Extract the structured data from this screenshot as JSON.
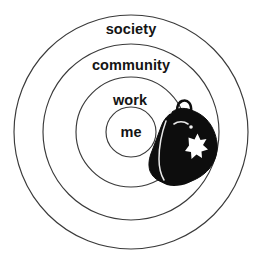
{
  "diagram": {
    "type": "concentric-rings",
    "title_visible": false,
    "background_color": "#ffffff",
    "stroke_color": "#3a3a3a",
    "text_color": "#141414",
    "center": {
      "x": 131,
      "y": 132
    },
    "rings": [
      {
        "key": "society",
        "label": "society",
        "radius": 117,
        "label_x": 131,
        "label_y": 29
      },
      {
        "key": "community",
        "label": "community",
        "radius": 88,
        "label_x": 131,
        "label_y": 65
      },
      {
        "key": "work",
        "label": "work",
        "radius": 55,
        "label_x": 130,
        "label_y": 100
      },
      {
        "key": "me",
        "label": "me",
        "radius": 25,
        "label_x": 131,
        "label_y": 132
      }
    ],
    "overlay": {
      "name": "medical-bag",
      "description": "black bag with handle and white cross",
      "fill_color": "#0d0d0d",
      "mark_color": "#ffffff",
      "mark": "cross",
      "position": {
        "x": 150,
        "y": 103,
        "width": 72,
        "height": 86
      }
    }
  }
}
